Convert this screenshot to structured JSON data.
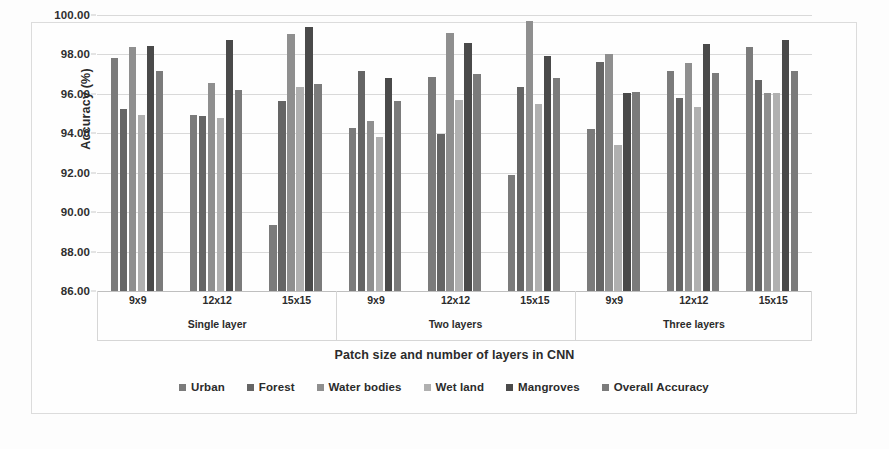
{
  "chart_data": {
    "type": "bar",
    "title": "",
    "xlabel": "Patch size and number of layers in CNN",
    "ylabel": "Accuracy (%)",
    "ylim": [
      86.0,
      100.0
    ],
    "ytick_step": 2.0,
    "ytick_labels": [
      "100.00",
      "98.00",
      "96.00",
      "94.00",
      "92.00",
      "90.00",
      "88.00",
      "86.00"
    ],
    "ytick_values": [
      100.0,
      98.0,
      96.0,
      94.0,
      92.0,
      90.0,
      88.0,
      86.0
    ],
    "grid": true,
    "legend_position": "bottom",
    "categories": [
      "9x9",
      "12x12",
      "15x15",
      "9x9",
      "12x12",
      "15x15",
      "9x9",
      "12x12",
      "15x15"
    ],
    "group_labels": [
      "Single layer",
      "Two layers",
      "Three layers"
    ],
    "group_sizes": [
      3,
      3,
      3
    ],
    "series": [
      {
        "name": "Urban",
        "color": "#7b7b7b",
        "values": [
          97.8,
          94.95,
          89.35,
          94.25,
          96.85,
          91.9,
          94.2,
          97.15,
          98.4
        ]
      },
      {
        "name": "Forest",
        "color": "#656565",
        "values": [
          95.25,
          94.9,
          95.65,
          97.15,
          93.95,
          96.35,
          97.6,
          95.8,
          96.7
        ]
      },
      {
        "name": "Water bodies",
        "color": "#8f8f8f",
        "values": [
          98.4,
          96.55,
          99.05,
          94.6,
          99.1,
          99.7,
          98.0,
          97.55,
          96.05
        ]
      },
      {
        "name": "Wet land",
        "color": "#b0b0b0",
        "values": [
          94.95,
          94.8,
          96.35,
          93.8,
          95.7,
          95.5,
          93.4,
          95.35,
          96.05
        ]
      },
      {
        "name": "Mangroves",
        "color": "#4a4a4a",
        "values": [
          98.45,
          98.75,
          99.4,
          96.8,
          98.6,
          97.9,
          96.05,
          98.55,
          98.75
        ]
      },
      {
        "name": "Overall Accuracy",
        "color": "#7b7b7b",
        "values": [
          97.15,
          96.2,
          96.5,
          95.65,
          97.0,
          96.8,
          96.1,
          97.05,
          97.15
        ]
      }
    ]
  },
  "legend": {
    "items": [
      {
        "label": "Urban",
        "color": "#7b7b7b"
      },
      {
        "label": "Forest",
        "color": "#656565"
      },
      {
        "label": "Water bodies",
        "color": "#8f8f8f"
      },
      {
        "label": "Wet land",
        "color": "#b0b0b0"
      },
      {
        "label": "Mangroves",
        "color": "#4a4a4a"
      },
      {
        "label": "Overall Accuracy",
        "color": "#7b7b7b"
      }
    ]
  }
}
